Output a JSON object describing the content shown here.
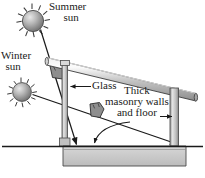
{
  "figure": {
    "type": "cross-section-diagram",
    "background_color": "#ffffff",
    "line_color": "#1a1a1a",
    "structure_fill": "#b8b8b8",
    "slab_fill": "#c9c9c9",
    "sun_fill": "#9a9a9a"
  },
  "labels": {
    "summer_sun": {
      "line1": "Summer",
      "line2": "sun"
    },
    "winter_sun": {
      "line1": "Winter",
      "line2": "sun"
    },
    "glass": "Glass",
    "masonry": {
      "line1": "Thick",
      "line2": "masonry walls",
      "line3": "and floor"
    }
  },
  "icons": {
    "summer_sun": "sun-icon",
    "winter_sun": "sun-icon",
    "summer_ray_arrowhead": "ray-arrowhead-icon",
    "winter_ray_arrowhead": "ray-arrowhead-icon",
    "glass_leader_arrow": "leader-arrow-icon",
    "masonry_wall_arrow": "leader-arrow-icon",
    "masonry_floor_arrow": "leader-arrow-icon"
  },
  "elements": {
    "roof_beam": "sloped-roof-beam",
    "glass_wall": "glass-wall",
    "right_wall": "masonry-right-wall",
    "floor_slab": "masonry-floor-slab",
    "ground_line": "ground-line",
    "summer_ray": "summer-sun-ray",
    "winter_ray": "winter-sun-ray"
  }
}
